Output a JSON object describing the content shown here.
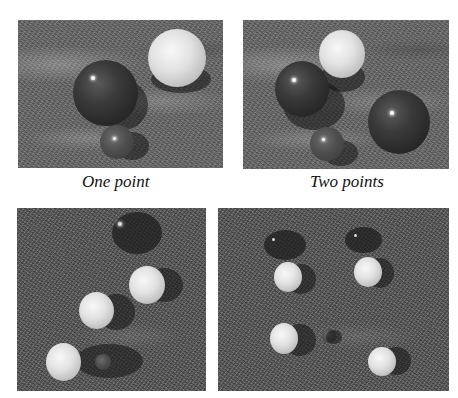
{
  "figure": {
    "panels": [
      {
        "id": "top-left",
        "caption": "One point",
        "description": "Rendered scene: dark sphere, white sphere and small dark sphere on granite texture with soft shadows"
      },
      {
        "id": "top-right",
        "caption": "Two points",
        "description": "Rendered scene: dark sphere, white sphere, small dark sphere and large dark sphere on granite texture"
      },
      {
        "id": "bottom-left",
        "caption": "",
        "description": "Top-down scene: three white spheres with elongated dark shadows and a dark ellipse on granite texture"
      },
      {
        "id": "bottom-right",
        "caption": "",
        "description": "Top-down scene: four white spheres with shadows, two dark ellipses and a small dark sphere on granite texture"
      }
    ]
  }
}
